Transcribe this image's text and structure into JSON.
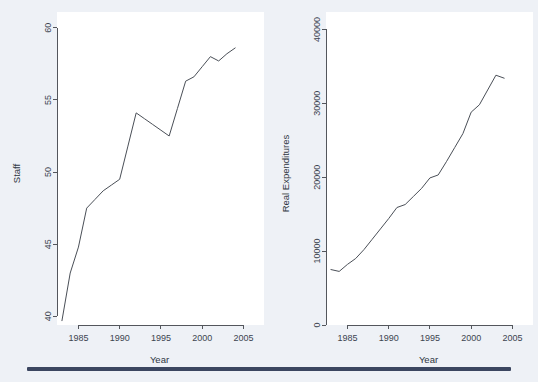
{
  "figure": {
    "background_color": "#eef1f6",
    "plot_background_color": "#ffffff",
    "line_color": "#4a4f57",
    "axis_color": "#53565c",
    "rule_color": "#3b4660"
  },
  "panels": {
    "left": {
      "name": "staff-panel"
    },
    "right": {
      "name": "real-expenditures-panel"
    }
  },
  "chart_data": [
    {
      "type": "line",
      "title": "",
      "xlabel": "Year",
      "ylabel": "Staff",
      "xlim": [
        1982.4,
        2005.8
      ],
      "ylim": [
        39.4,
        60.4
      ],
      "xticks": [
        1985,
        1990,
        1995,
        2000,
        2005
      ],
      "xtick_labels": [
        "1985",
        "1990",
        "1995",
        "2000",
        "2005"
      ],
      "yticks": [
        40,
        45,
        50,
        55,
        60
      ],
      "ytick_labels": [
        "40",
        "45",
        "50",
        "55",
        "60"
      ],
      "grid": false,
      "legend": false,
      "x": [
        1983,
        1984,
        1985,
        1986,
        1987,
        1988,
        1989,
        1990,
        1991,
        1992,
        1993,
        1994,
        1995,
        1996,
        1997,
        1998,
        1999,
        2000,
        2001,
        2002,
        2003,
        2004
      ],
      "values": [
        39.7,
        43.0,
        44.8,
        47.5,
        48.1,
        48.7,
        49.1,
        49.5,
        51.8,
        54.1,
        53.7,
        53.3,
        52.9,
        52.5,
        54.4,
        56.3,
        56.6,
        57.3,
        58.0,
        57.7,
        58.2,
        58.6
      ],
      "series": [
        {
          "name": "Staff",
          "values": [
            39.7,
            43.0,
            44.8,
            47.5,
            48.1,
            48.7,
            49.1,
            49.5,
            51.8,
            54.1,
            53.7,
            53.3,
            52.9,
            52.5,
            54.4,
            56.3,
            56.6,
            57.3,
            58.0,
            57.7,
            58.2,
            58.6
          ]
        }
      ]
    },
    {
      "type": "line",
      "title": "",
      "xlabel": "Year",
      "ylabel": "Real Expenditures",
      "xlim": [
        1982.4,
        2005.8
      ],
      "ylim": [
        0,
        41000
      ],
      "xticks": [
        1985,
        1990,
        1995,
        2000,
        2005
      ],
      "xtick_labels": [
        "1985",
        "1990",
        "1995",
        "2000",
        "2005"
      ],
      "yticks": [
        0,
        10000,
        20000,
        30000,
        40000
      ],
      "ytick_labels": [
        "0",
        "10000",
        "20000",
        "30000",
        "40000"
      ],
      "grid": false,
      "legend": false,
      "x": [
        1983,
        1984,
        1985,
        1986,
        1987,
        1988,
        1989,
        1990,
        1991,
        1992,
        1993,
        1994,
        1995,
        1996,
        1997,
        1998,
        1999,
        2000,
        2001,
        2002,
        2003,
        2004
      ],
      "values": [
        7500,
        7250,
        8200,
        9000,
        10200,
        11600,
        13000,
        14400,
        15900,
        16300,
        17400,
        18500,
        19900,
        20300,
        22100,
        24000,
        25900,
        28800,
        29800,
        31800,
        33800,
        33400
      ],
      "series": [
        {
          "name": "Real Expenditures",
          "values": [
            7500,
            7250,
            8200,
            9000,
            10200,
            11600,
            13000,
            14400,
            15900,
            16300,
            17400,
            18500,
            19900,
            20300,
            22100,
            24000,
            25900,
            28800,
            29800,
            31800,
            33800,
            33400
          ]
        }
      ]
    }
  ]
}
